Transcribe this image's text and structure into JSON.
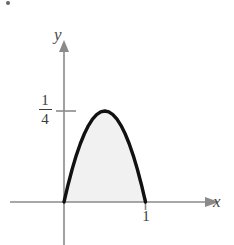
{
  "figure": {
    "background_color": "#ffffff",
    "width": 234,
    "height": 245
  },
  "axes": {
    "x_label": "x",
    "y_label": "y",
    "axis_color": "#8a8a8a",
    "arrowheads": [
      "x-right",
      "y-up"
    ]
  },
  "labels": {
    "y_tick_numerator": "1",
    "y_tick_denominator": "4",
    "x_tick_one": "1"
  },
  "curve": {
    "stroke_color": "#111111",
    "fill_color": "#f1f1f1",
    "stroke_width": 3.4
  },
  "chart_data": {
    "type": "line",
    "title": "",
    "xlabel": "x",
    "ylabel": "y",
    "xlim": [
      -0.35,
      1.55
    ],
    "ylim": [
      -0.18,
      0.42
    ],
    "x_ticks": [
      1
    ],
    "x_tick_labels": [
      "1"
    ],
    "y_ticks": [
      0.25
    ],
    "y_tick_labels": [
      "1/4"
    ],
    "grid": false,
    "legend": null,
    "series": [
      {
        "name": "y = x(1 - x)",
        "shaded_region": true,
        "shade_between": [
          0,
          1
        ],
        "x": [
          0.0,
          0.05,
          0.1,
          0.15,
          0.2,
          0.25,
          0.3,
          0.35,
          0.4,
          0.45,
          0.5,
          0.55,
          0.6,
          0.65,
          0.7,
          0.75,
          0.8,
          0.85,
          0.9,
          0.95,
          1.0
        ],
        "values": [
          0.0,
          0.0475,
          0.09,
          0.1275,
          0.16,
          0.1875,
          0.21,
          0.2275,
          0.24,
          0.2475,
          0.25,
          0.2475,
          0.24,
          0.2275,
          0.21,
          0.1875,
          0.16,
          0.1275,
          0.09,
          0.0475,
          0.0
        ]
      }
    ],
    "annotations": [
      {
        "text": "1/4",
        "x": 0,
        "y": 0.25,
        "position": "left-of-y-axis"
      },
      {
        "text": "1",
        "x": 1,
        "y": 0,
        "position": "below-x-axis"
      }
    ]
  }
}
